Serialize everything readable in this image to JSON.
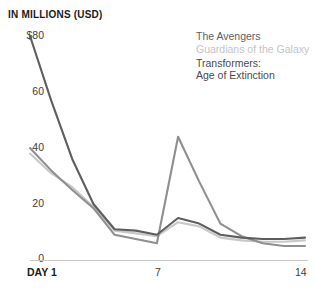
{
  "chart_data": {
    "type": "line",
    "title": "IN MILLIONS (USD)",
    "xlabel": "",
    "ylabel": "IN MILLIONS (USD)",
    "x": [
      1,
      2,
      3,
      4,
      5,
      6,
      7,
      8,
      9,
      10,
      11,
      12,
      13,
      14
    ],
    "xlim": [
      1,
      14
    ],
    "ylim": [
      0,
      80
    ],
    "yticks": [
      0,
      20,
      40,
      60,
      80
    ],
    "ytick_labels": [
      "0",
      "20",
      "40",
      "60",
      "$80"
    ],
    "xticks": [
      1,
      7,
      14
    ],
    "xtick_labels": [
      "DAY 1",
      "7",
      "14"
    ],
    "grid": false,
    "legend_position": "top-right",
    "series": [
      {
        "name": "The Avengers",
        "color": "#5e5e5e",
        "values": [
          80.0,
          57.0,
          36.0,
          20.0,
          11.0,
          10.5,
          9.0,
          15.0,
          13.0,
          9.0,
          8.0,
          7.5,
          7.5,
          8.0
        ]
      },
      {
        "name": "Guardians of the Galaxy",
        "color": "#c8c8c8",
        "values": [
          38.0,
          31.0,
          26.0,
          19.0,
          10.5,
          9.5,
          8.5,
          13.5,
          12.0,
          8.0,
          7.0,
          6.5,
          6.5,
          7.0
        ]
      },
      {
        "name": "Transformers: Age of Extinction",
        "color": "#8f8f8f",
        "values": [
          40.0,
          32.0,
          25.0,
          18.5,
          9.0,
          7.5,
          6.0,
          44.0,
          28.0,
          13.0,
          8.5,
          6.0,
          5.0,
          5.0
        ]
      }
    ]
  },
  "legend": {
    "entries": [
      {
        "label": "The Avengers",
        "color": "#5e5e5e",
        "lines": [
          "The Avengers"
        ]
      },
      {
        "label": "Guardians of the Galaxy",
        "color": "#c4c4c4",
        "lines": [
          "Guardians of the Galaxy"
        ]
      },
      {
        "label": "Transformers: Age of Extinction",
        "color": "#4a4a4a",
        "lines": [
          "Transformers:",
          "Age of Extinction"
        ]
      }
    ]
  },
  "axis": {
    "header": "IN MILLIONS (USD)",
    "y_labels": [
      "$80",
      "60",
      "40",
      "20",
      "0"
    ],
    "x_labels": [
      "DAY 1",
      "7",
      "14"
    ]
  },
  "colors": {
    "avengers": "#5e5e5e",
    "guardians": "#c8c8c8",
    "transformers": "#8f8f8f",
    "text": "#1b1b1b",
    "baseline": "#c9c9c9",
    "background": "#ffffff"
  }
}
